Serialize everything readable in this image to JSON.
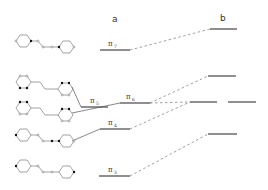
{
  "columns": {
    "a": {
      "label": "a"
    },
    "b": {
      "label": "b"
    }
  },
  "levels_a": [
    {
      "id": "pi7",
      "symbol": "π",
      "subscript": "7",
      "x1": 100,
      "x2": 130,
      "y": 50
    },
    {
      "id": "pi5",
      "symbol": "π",
      "subscript": "5",
      "x1": 81,
      "x2": 108,
      "y": 107
    },
    {
      "id": "pi6",
      "symbol": "π",
      "subscript": "6",
      "x1": 120,
      "x2": 150,
      "y": 103
    },
    {
      "id": "pi4",
      "symbol": "π",
      "subscript": "4",
      "x1": 100,
      "x2": 130,
      "y": 129
    },
    {
      "id": "pi3",
      "symbol": "π",
      "subscript": "3",
      "x1": 99,
      "x2": 130,
      "y": 176
    }
  ],
  "levels_b": [
    {
      "id": "b1",
      "x1": 210,
      "x2": 237,
      "y": 29
    },
    {
      "id": "b2",
      "x1": 208,
      "x2": 236,
      "y": 76
    },
    {
      "id": "b3",
      "x1": 190,
      "x2": 217,
      "y": 102
    },
    {
      "id": "b4",
      "x1": 228,
      "x2": 256,
      "y": 102
    },
    {
      "id": "b5",
      "x1": 208,
      "x2": 237,
      "y": 134
    }
  ],
  "molecules": [
    {
      "id": "mo-pi7",
      "label": "orbital pi7 diagram"
    },
    {
      "id": "mo-pi5",
      "label": "orbital pi5 diagram"
    },
    {
      "id": "mo-pi6",
      "label": "orbital pi6 diagram"
    },
    {
      "id": "mo-pi4",
      "label": "orbital pi4 diagram"
    },
    {
      "id": "mo-pi3",
      "label": "orbital pi3 diagram"
    }
  ]
}
